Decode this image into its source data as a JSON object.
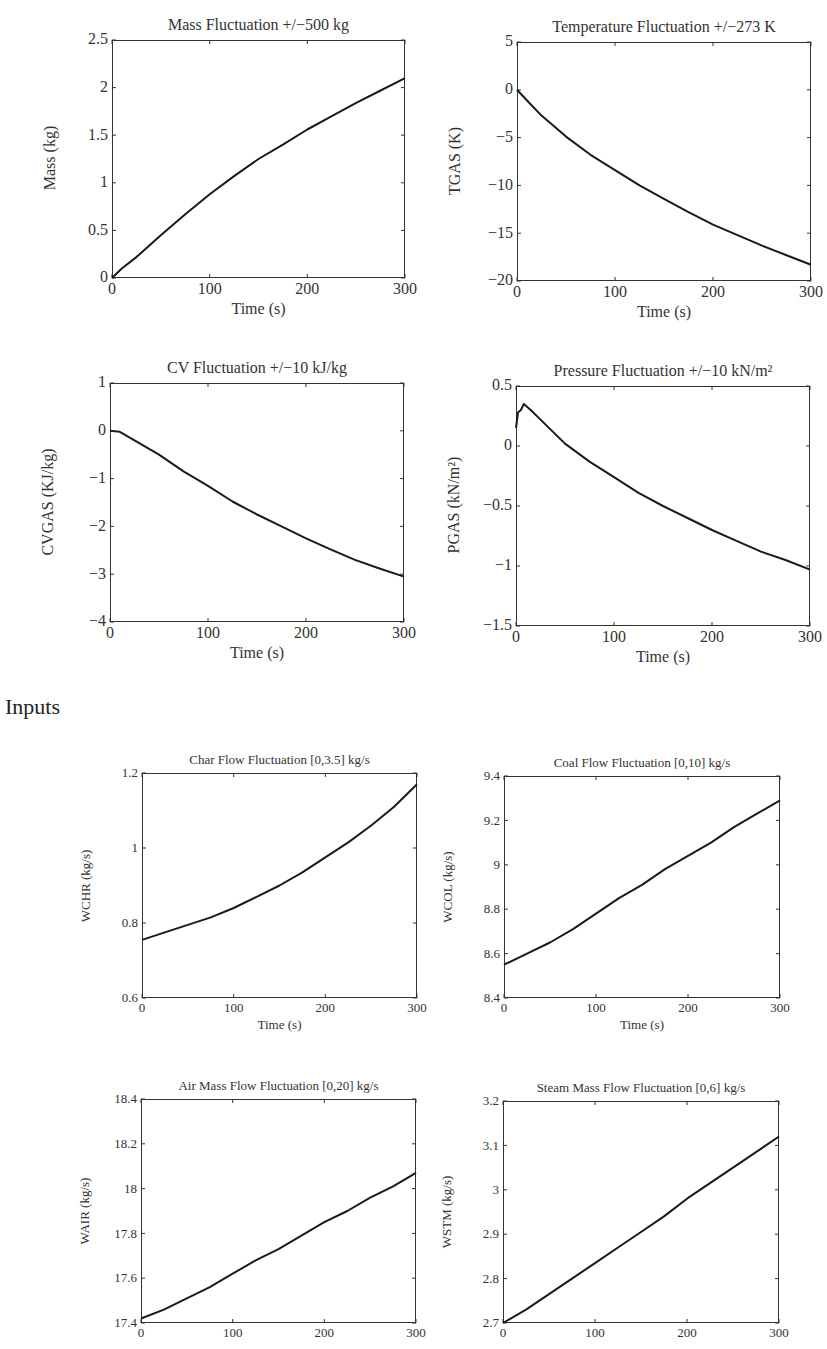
{
  "sections": {
    "outputs_label": "",
    "inputs_label": "Inputs"
  },
  "chart_data": [
    {
      "id": "mass",
      "type": "line",
      "title": "Mass Fluctuation +/−500 kg",
      "xlabel": "Time (s)",
      "ylabel": "Mass (kg)",
      "xlim": [
        0,
        300
      ],
      "ylim": [
        0,
        2.5
      ],
      "xticks": [
        "0",
        "100",
        "200",
        "300"
      ],
      "yticks": [
        "0",
        "0.5",
        "1",
        "1.5",
        "2",
        "2.5"
      ],
      "ytick_values": [
        0,
        0.5,
        1,
        1.5,
        2,
        2.5
      ],
      "grid": false,
      "x": [
        0,
        10,
        25,
        50,
        75,
        100,
        125,
        150,
        175,
        200,
        225,
        250,
        275,
        300
      ],
      "values": [
        0,
        0.1,
        0.22,
        0.45,
        0.67,
        0.88,
        1.07,
        1.25,
        1.4,
        1.56,
        1.7,
        1.84,
        1.97,
        2.1
      ]
    },
    {
      "id": "temperature",
      "type": "line",
      "title": "Temperature Fluctuation +/−273 K",
      "xlabel": "Time (s)",
      "ylabel": "TGAS (K)",
      "xlim": [
        0,
        300
      ],
      "ylim": [
        -20,
        5
      ],
      "xticks": [
        "0",
        "100",
        "200",
        "300"
      ],
      "yticks": [
        "−20",
        "−15",
        "−10",
        "−5",
        "0",
        "5"
      ],
      "ytick_values": [
        -20,
        -15,
        -10,
        -5,
        0,
        5
      ],
      "grid": false,
      "x": [
        0,
        10,
        25,
        50,
        75,
        100,
        125,
        150,
        175,
        200,
        225,
        250,
        275,
        300
      ],
      "values": [
        0,
        -1.1,
        -2.7,
        -4.9,
        -6.8,
        -8.4,
        -10.0,
        -11.4,
        -12.8,
        -14.1,
        -15.2,
        -16.3,
        -17.3,
        -18.3
      ]
    },
    {
      "id": "cv",
      "type": "line",
      "title": "CV Fluctuation +/−10 kJ/kg",
      "xlabel": "Time (s)",
      "ylabel": "CVGAS (KJ/kg)",
      "xlim": [
        0,
        300
      ],
      "ylim": [
        -4,
        1
      ],
      "xticks": [
        "0",
        "100",
        "200",
        "300"
      ],
      "yticks": [
        "−4",
        "−3",
        "−2",
        "−1",
        "0",
        "1"
      ],
      "ytick_values": [
        -4,
        -3,
        -2,
        -1,
        0,
        1
      ],
      "grid": false,
      "x": [
        0,
        10,
        25,
        50,
        75,
        100,
        125,
        150,
        175,
        200,
        225,
        250,
        275,
        300
      ],
      "values": [
        0,
        -0.02,
        -0.2,
        -0.5,
        -0.85,
        -1.15,
        -1.48,
        -1.75,
        -2.0,
        -2.25,
        -2.48,
        -2.7,
        -2.88,
        -3.05
      ]
    },
    {
      "id": "pressure",
      "type": "line",
      "title": "Pressure Fluctuation +/−10 kN/m²",
      "xlabel": "Time (s)",
      "ylabel": "PGAS (kN/m²)",
      "xlim": [
        0,
        300
      ],
      "ylim": [
        -1.5,
        0.5
      ],
      "xticks": [
        "0",
        "100",
        "200",
        "300"
      ],
      "yticks": [
        "−1.5",
        "−1",
        "−0.5",
        "0",
        "0.5"
      ],
      "ytick_values": [
        -1.5,
        -1,
        -0.5,
        0,
        0.5
      ],
      "grid": false,
      "x": [
        0,
        2,
        5,
        8,
        15,
        25,
        50,
        75,
        100,
        125,
        150,
        175,
        200,
        225,
        250,
        275,
        300
      ],
      "values": [
        0.15,
        0.28,
        0.3,
        0.35,
        0.3,
        0.22,
        0.02,
        -0.13,
        -0.26,
        -0.39,
        -0.5,
        -0.6,
        -0.7,
        -0.79,
        -0.88,
        -0.95,
        -1.03
      ]
    },
    {
      "id": "char_flow",
      "type": "line",
      "title": "Char Flow Fluctuation [0,3.5] kg/s",
      "xlabel": "Time (s)",
      "ylabel": "WCHR (kg/s)",
      "xlim": [
        0,
        300
      ],
      "ylim": [
        0.6,
        1.2
      ],
      "xticks": [
        "0",
        "100",
        "200",
        "300"
      ],
      "yticks": [
        "0.6",
        "0.8",
        "1",
        "1.2"
      ],
      "ytick_values": [
        0.6,
        0.8,
        1.0,
        1.2
      ],
      "grid": false,
      "x": [
        0,
        25,
        50,
        75,
        100,
        125,
        150,
        175,
        200,
        225,
        250,
        275,
        300
      ],
      "values": [
        0.755,
        0.775,
        0.795,
        0.815,
        0.84,
        0.87,
        0.9,
        0.935,
        0.975,
        1.015,
        1.06,
        1.11,
        1.17
      ]
    },
    {
      "id": "coal_flow",
      "type": "line",
      "title": "Coal Flow Fluctuation [0,10] kg/s",
      "xlabel": "Time (s)",
      "ylabel": "WCOL (kg/s)",
      "xlim": [
        0,
        300
      ],
      "ylim": [
        8.4,
        9.4
      ],
      "xticks": [
        "0",
        "100",
        "200",
        "300"
      ],
      "yticks": [
        "8.4",
        "8.6",
        "8.8",
        "9",
        "9.2",
        "9.4"
      ],
      "ytick_values": [
        8.4,
        8.6,
        8.8,
        9.0,
        9.2,
        9.4
      ],
      "grid": false,
      "x": [
        0,
        25,
        50,
        75,
        100,
        125,
        150,
        175,
        200,
        225,
        250,
        275,
        300
      ],
      "values": [
        8.55,
        8.6,
        8.65,
        8.71,
        8.78,
        8.85,
        8.91,
        8.98,
        9.04,
        9.1,
        9.17,
        9.23,
        9.29
      ]
    },
    {
      "id": "air_flow",
      "type": "line",
      "title": "Air Mass Flow Fluctuation [0,20] kg/s",
      "xlabel": "",
      "ylabel": "WAIR (kg/s)",
      "xlim": [
        0,
        300
      ],
      "ylim": [
        17.4,
        18.4
      ],
      "xticks": [
        "0",
        "100",
        "200",
        "300"
      ],
      "yticks": [
        "17.4",
        "17.6",
        "17.8",
        "18",
        "18.2",
        "18.4"
      ],
      "ytick_values": [
        17.4,
        17.6,
        17.8,
        18.0,
        18.2,
        18.4
      ],
      "grid": false,
      "x": [
        0,
        25,
        50,
        75,
        100,
        125,
        150,
        175,
        200,
        225,
        250,
        275,
        300
      ],
      "values": [
        17.42,
        17.46,
        17.51,
        17.56,
        17.62,
        17.68,
        17.73,
        17.79,
        17.85,
        17.9,
        17.96,
        18.01,
        18.07
      ]
    },
    {
      "id": "steam_flow",
      "type": "line",
      "title": "Steam Mass Flow Fluctuation [0,6] kg/s",
      "xlabel": "",
      "ylabel": "WSTM (kg/s)",
      "xlim": [
        0,
        300
      ],
      "ylim": [
        2.7,
        3.2
      ],
      "xticks": [
        "0",
        "100",
        "200",
        "300"
      ],
      "yticks": [
        "2.7",
        "2.8",
        "2.9",
        "3",
        "3.1",
        "3.2"
      ],
      "ytick_values": [
        2.7,
        2.8,
        2.9,
        3.0,
        3.1,
        3.2
      ],
      "grid": false,
      "x": [
        0,
        25,
        50,
        75,
        100,
        125,
        150,
        175,
        200,
        225,
        250,
        275,
        300
      ],
      "values": [
        2.7,
        2.73,
        2.765,
        2.8,
        2.835,
        2.87,
        2.905,
        2.94,
        2.98,
        3.015,
        3.05,
        3.085,
        3.12
      ]
    }
  ]
}
